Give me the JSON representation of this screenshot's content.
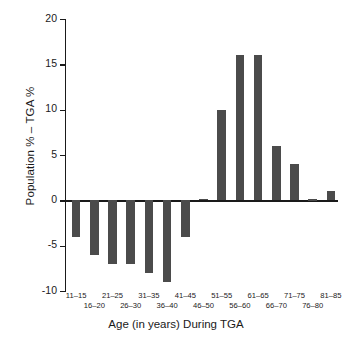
{
  "chart_data": {
    "type": "bar",
    "title": "",
    "xlabel": "Age (in years) During TGA",
    "ylabel": "Population % – TGA %",
    "categories": [
      "11–15",
      "16–20",
      "21–25",
      "26–30",
      "31–35",
      "36–40",
      "41–45",
      "46–50",
      "51–55",
      "56–60",
      "61–65",
      "66–70",
      "71–75",
      "76–80",
      "81–85"
    ],
    "values": [
      -4,
      -6,
      -7,
      -7,
      -8,
      -9,
      -4,
      0.2,
      10,
      16,
      16,
      6,
      4,
      0.1,
      1
    ],
    "ylim": [
      -10,
      20
    ],
    "yticks": [
      20,
      15,
      10,
      5,
      0,
      -5,
      -10
    ],
    "ytick_labels": [
      "20",
      "15",
      "10",
      "5",
      "0",
      "-5",
      "-10"
    ],
    "grid": false,
    "legend": null,
    "bar_color": "#4b4b4b",
    "axis_color": "#1a1a1a",
    "background": "#ffffff",
    "xtick_label_rows": [
      0,
      1,
      0,
      1,
      0,
      1,
      0,
      1,
      0,
      1,
      0,
      1,
      0,
      1,
      0
    ]
  }
}
